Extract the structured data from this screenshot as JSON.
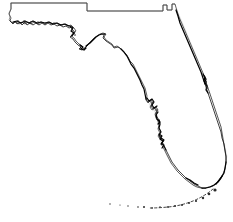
{
  "figure": {
    "kind": "outline-map",
    "width": 233,
    "height": 222,
    "background_color": "#ffffff",
    "outline_color": "#1a1a1a",
    "border_color": "#555555",
    "halo_color": "#cfcfcf",
    "island_color": "#2b2b2b",
    "line_style": "thin-black-outline",
    "fill_style": "none",
    "labels_present": false,
    "title_text": "",
    "caption_text": ""
  },
  "regions": [
    {
      "id": "panhandle",
      "name": "Panhandle"
    },
    {
      "id": "big-bend",
      "name": "Big Bend"
    },
    {
      "id": "gulf-coast",
      "name": "Gulf Coast"
    },
    {
      "id": "tampa-bay",
      "name": "Tampa Bay"
    },
    {
      "id": "charlotte-harbor",
      "name": "Charlotte Harbor"
    },
    {
      "id": "everglades-tip",
      "name": "Southern Tip"
    },
    {
      "id": "atlantic-coast",
      "name": "Atlantic Coast"
    },
    {
      "id": "cape-canaveral",
      "name": "Cape Canaveral"
    },
    {
      "id": "northern-border",
      "name": "Northern State Border"
    },
    {
      "id": "florida-keys",
      "name": "Florida Keys"
    }
  ],
  "geometry": {
    "landmass_path": "M 11 4 L 11 9 L 9 14 L 11 18 L 10 21 L 13 23 L 16 22 L 19 24 L 22 22 L 25 24 L 28 22 L 31 24 L 34 22 L 38 24 L 41 22 L 45 24 L 48 22 L 52 24 L 56 23 L 60 25 L 64 24 L 68 26 L 71 25 L 74 28 L 76 31 L 73 33 L 71 36 L 74 38 L 76 41 L 79 44 L 82 46 L 80 48 L 83 49 L 86 47 L 88 44 L 91 41 L 94 38 L 97 36 L 100 34 L 103 33 L 106 34 L 104 37 L 106 40 L 109 42 L 112 44 L 114 47 L 117 46 L 120 48 L 123 51 L 126 54 L 128 57 L 130 61 L 133 64 L 135 68 L 137 72 L 139 76 L 141 80 L 143 84 L 145 88 L 146 92 L 147 96 L 146 100 L 148 103 L 150 101 L 152 104 L 150 107 L 152 110 L 155 108 L 157 111 L 155 114 L 156 118 L 158 121 L 159 125 L 158 129 L 160 133 L 158 136 L 160 139 L 163 141 L 161 144 L 163 147 L 165 151 L 167 155 L 169 159 L 171 163 L 174 167 L 177 171 L 181 175 L 185 179 L 189 182 L 193 185 L 197 187 L 201 188 L 205 188 L 209 187 L 213 186 L 217 183 L 220 179 L 223 174 L 225 169 L 226 163 L 226 157 L 225 151 L 224 145 L 223 139 L 222 133 L 221 127 L 219 121 L 217 115 L 215 109 L 213 103 L 211 97 L 209 91 L 207 85 L 205 79 L 203 73 L 200 66 L 197 59 L 194 52 L 191 45 L 188 38 L 185 31 L 182 24 L 179 17 L 177 11 L 175 4 L 172 4 L 172 10 L 167 10 L 167 5 L 163 5 L 163 11 L 87 11 L 87 3 L 11 3 Z",
    "northern_border_path": "M 11 3 L 87 3 L 87 11 L 163 11 L 163 5 L 167 5 L 167 10 L 172 10 L 172 4 L 175 4",
    "panhandle_west_path": "M 11 3 L 11 9 L 9 13 L 10 17 L 9 20 L 11 22",
    "coast_detail_paths": [
      "M 10 21 L 13 24 L 15 21 L 17 24 L 20 22 L 22 25 L 25 22 L 27 25 L 30 23 L 33 25 L 36 23 L 39 25 L 42 23 L 45 25 L 48 23 L 51 25 L 54 24 L 57 26 L 60 25 L 63 27 L 66 26 L 69 28 L 72 27",
      "M 13 22 L 17 21 L 21 23 L 25 21 L 29 23 L 33 21 L 37 23 L 41 22 L 45 23 L 49 22 L 53 24 L 57 23 L 61 25 L 65 24 L 69 26",
      "M 70 27 L 73 30 L 75 33 L 72 35 L 70 37 L 73 39 L 75 42 L 78 45 L 81 47 L 79 49 L 82 50 L 85 48 L 88 45",
      "M 86 46 L 90 43 L 93 40 L 96 37 L 99 35 L 102 34 L 105 34",
      "M 104 35 L 103 38 L 106 41 L 109 43 L 112 45 L 114 48 L 118 47 L 121 49",
      "M 121 49 L 124 52 L 127 56 L 129 60 L 131 64 L 134 68 L 136 72 L 138 76 L 140 80 L 142 85 L 144 89 L 145 94 L 146 99",
      "M 146 99 L 148 102 L 151 100 L 153 103 L 151 106 L 153 109 L 156 107 L 158 110 L 156 113 L 157 117 L 159 120",
      "M 159 120 L 160 124 L 159 128 L 161 132 L 159 135 L 161 138 L 164 140 L 162 143 L 164 146 L 166 150",
      "M 166 150 L 168 154 L 170 158 L 172 162 L 175 166 L 178 170 L 182 174 L 186 178 L 190 181 L 194 184 L 198 186 L 202 188",
      "M 202 188 L 206 188 L 210 187 L 214 185 L 218 182 L 221 178 L 224 173 L 225 168 L 226 162",
      "M 226 162 L 226 156 L 225 150 L 224 144 L 222 138 L 221 132 L 219 126 L 217 120 L 215 114 L 213 108 L 211 102 L 209 96 L 207 90 L 205 84",
      "M 205 84 L 203 78 L 201 72 L 198 65 L 195 58 L 192 51 L 189 44 L 186 37 L 183 30 L 180 23 L 178 16 L 176 10"
    ],
    "inlet_detail_paths": [
      "M 147 98 L 149 101 L 152 99 L 154 102 L 152 105 L 154 108 L 157 106",
      "M 158 112 L 156 115 L 157 119 L 160 122 L 158 124",
      "M 159 134 L 162 136 L 160 139 L 163 141 L 161 144 L 164 145 L 162 148",
      "M 204 76 L 206 79 L 205 83 L 207 86 L 206 90 L 208 93",
      "M 203 74 L 205 77 L 204 81 L 206 84",
      "M 80 45 L 83 47 L 81 49 L 84 50 L 86 48",
      "M 70 26 L 73 28 L 71 31 L 74 33 L 72 36",
      "M 186 178 L 190 180 L 194 183 L 198 185",
      "M 216 184 L 219 180 L 222 176"
    ],
    "halo_paths": [
      "M 16 22 L 30 24 L 48 24 L 66 26 L 74 30 L 76 36 L 82 46 L 90 43 L 100 35 L 108 42 L 120 48 L 130 60 L 140 80 L 146 98",
      "M 150 104 L 156 112 L 159 124 L 161 140 L 168 156 L 180 172 L 196 186 L 212 186 L 224 172 L 226 156 L 220 126 L 208 90 L 196 58 L 182 24 L 176 10"
    ],
    "keys_path": "M 213 189 Q 205 196 193 201 Q 180 206 168 207 Q 158 208 150 208",
    "key_dots": [
      {
        "cx": 215,
        "cy": 190,
        "r": 1.6
      },
      {
        "cx": 209,
        "cy": 194,
        "r": 1.3
      },
      {
        "cx": 203,
        "cy": 198,
        "r": 1.2
      },
      {
        "cx": 196,
        "cy": 201,
        "r": 1.1
      },
      {
        "cx": 189,
        "cy": 203,
        "r": 1.0
      },
      {
        "cx": 182,
        "cy": 205,
        "r": 1.0
      },
      {
        "cx": 175,
        "cy": 206,
        "r": 0.9
      },
      {
        "cx": 168,
        "cy": 207,
        "r": 0.9
      },
      {
        "cx": 160,
        "cy": 207,
        "r": 0.8
      },
      {
        "cx": 152,
        "cy": 208,
        "r": 0.8
      },
      {
        "cx": 144,
        "cy": 207,
        "r": 1.0
      },
      {
        "cx": 138,
        "cy": 207,
        "r": 0.8
      },
      {
        "cx": 128,
        "cy": 206,
        "r": 0.7
      },
      {
        "cx": 120,
        "cy": 205,
        "r": 0.6
      },
      {
        "cx": 110,
        "cy": 204,
        "r": 0.7
      }
    ],
    "barrier_islands": [
      {
        "cx": 18,
        "cy": 21,
        "r": 0.8
      },
      {
        "cx": 24,
        "cy": 21,
        "r": 0.7
      },
      {
        "cx": 31,
        "cy": 22,
        "r": 0.7
      },
      {
        "cx": 38,
        "cy": 22,
        "r": 0.7
      },
      {
        "cx": 46,
        "cy": 23,
        "r": 0.7
      },
      {
        "cx": 54,
        "cy": 23,
        "r": 0.7
      },
      {
        "cx": 62,
        "cy": 25,
        "r": 0.7
      },
      {
        "cx": 72,
        "cy": 30,
        "r": 0.8
      },
      {
        "cx": 75,
        "cy": 35,
        "r": 0.8
      },
      {
        "cx": 152,
        "cy": 103,
        "r": 0.8
      },
      {
        "cx": 156,
        "cy": 110,
        "r": 0.8
      },
      {
        "cx": 160,
        "cy": 137,
        "r": 0.9
      },
      {
        "cx": 163,
        "cy": 144,
        "r": 0.8
      },
      {
        "cx": 206,
        "cy": 82,
        "r": 1.0
      },
      {
        "cx": 207,
        "cy": 88,
        "r": 0.9
      }
    ]
  }
}
